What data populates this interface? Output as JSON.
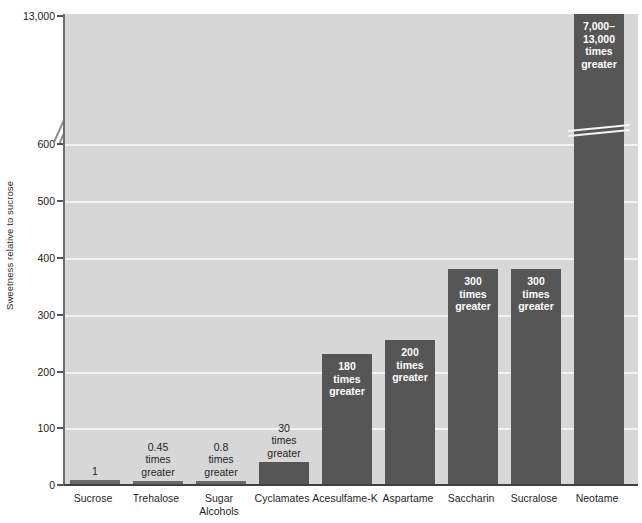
{
  "chart_data": {
    "type": "bar",
    "title": "",
    "xlabel": "",
    "ylabel": "Sweetness relative to sucrose",
    "grid": true,
    "legend": false,
    "axis_break": {
      "present": true,
      "lower_range": [
        0,
        600
      ],
      "upper_tick": "13,000",
      "note": "y-axis is broken between 600 and 13,000"
    },
    "ylim": [
      0,
      600
    ],
    "yticks": [
      "0",
      "100",
      "200",
      "300",
      "400",
      "500",
      "600",
      "13,000"
    ],
    "ytick_values": [
      0,
      100,
      200,
      300,
      400,
      500,
      600,
      13000
    ],
    "categories": [
      "Sucrose",
      "Trehalose",
      "Sugar\nAlcohols",
      "Cyclamates",
      "Acesulfame-K",
      "Aspartame",
      "Saccharin",
      "Sucralose",
      "Neotame"
    ],
    "values": [
      1,
      0.45,
      0.8,
      30,
      180,
      200,
      300,
      300,
      13000
    ],
    "point_labels": [
      "1",
      "0.45\ntimes\ngreater",
      "0.8\ntimes\ngreater",
      "30\ntimes\ngreater",
      "180\ntimes\ngreater",
      "200\ntimes\ngreater",
      "300\ntimes\ngreater",
      "300\ntimes\ngreater",
      "7,000–\n13,000\ntimes\ngreater"
    ],
    "label_placement": [
      "above",
      "above",
      "above",
      "above",
      "inside",
      "inside",
      "inside",
      "inside",
      "inside"
    ],
    "colors": {
      "bar": "#565656",
      "bar_small": "#6a6a6a",
      "plot_background": "#d7d7d7",
      "gridline": "#f2f2f2",
      "axis": "#404040",
      "label_inside": "#ffffff",
      "label_outside": "#1f1f1f",
      "page_background": "#ffffff"
    }
  },
  "axis": {
    "y_title": "Sweetness relative to sucrose",
    "ticks": [
      {
        "label": "13,000",
        "top": 16
      },
      {
        "label": "600",
        "top": 144
      },
      {
        "label": "500",
        "top": 201
      },
      {
        "label": "400",
        "top": 258
      },
      {
        "label": "300",
        "top": 315
      },
      {
        "label": "200",
        "top": 372
      },
      {
        "label": "100",
        "top": 428
      },
      {
        "label": "0",
        "top": 485
      }
    ]
  },
  "bars": [
    {
      "name": "sucrose",
      "label": "Sucrose",
      "value": "1",
      "value_label": "1",
      "place": "above",
      "left": 5,
      "width": 50,
      "height": 4,
      "xcenter": 30
    },
    {
      "name": "trehalose",
      "label": "Trehalose",
      "value": "0.45",
      "value_label": "0.45\ntimes\ngreater",
      "place": "above",
      "left": 68,
      "width": 50,
      "height": 3,
      "xcenter": 93
    },
    {
      "name": "sugar-alcohols",
      "label": "Sugar\nAlcohols",
      "value": "0.8",
      "value_label": "0.8\ntimes\ngreater",
      "place": "above",
      "left": 131,
      "width": 50,
      "height": 3,
      "xcenter": 156
    },
    {
      "name": "cyclamates",
      "label": "Cyclamates",
      "value": "30",
      "value_label": "30\ntimes\ngreater",
      "place": "above",
      "left": 194,
      "width": 50,
      "height": 22,
      "xcenter": 219
    },
    {
      "name": "acesulfame-k",
      "label": "Acesulfame-K",
      "value": "180",
      "value_label": "180\ntimes\ngreater",
      "place": "inside",
      "left": 257,
      "width": 50,
      "height": 130,
      "xcenter": 282
    },
    {
      "name": "aspartame",
      "label": "Aspartame",
      "value": "200",
      "value_label": "200\ntimes\ngreater",
      "place": "inside",
      "left": 320,
      "width": 50,
      "height": 144,
      "xcenter": 345
    },
    {
      "name": "saccharin",
      "label": "Saccharin",
      "value": "300",
      "value_label": "300\ntimes\ngreater",
      "place": "inside",
      "left": 383,
      "width": 50,
      "height": 215,
      "xcenter": 408
    },
    {
      "name": "sucralose",
      "label": "Sucralose",
      "value": "300",
      "value_label": "300\ntimes\ngreater",
      "place": "inside",
      "left": 446,
      "width": 50,
      "height": 215,
      "xcenter": 471
    },
    {
      "name": "neotame",
      "label": "Neotame",
      "value": "7,000-13,000",
      "value_label": "7,000–\n13,000\ntimes\ngreater",
      "place": "inside",
      "left": 509,
      "width": 50,
      "height": 470,
      "xcenter": 534
    }
  ]
}
